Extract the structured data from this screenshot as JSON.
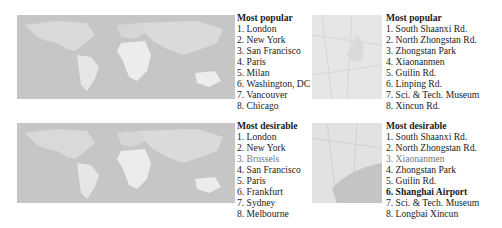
{
  "panels": [
    {
      "id": "world-popular",
      "title": "Most popular",
      "items": [
        "1. London",
        "2. New York",
        "3. San Francisco",
        "4. Paris",
        "5. Milan",
        "6. Washington, DC",
        "7. Vancouver",
        "8. Chicago"
      ]
    },
    {
      "id": "world-desirable",
      "title": "Most desirable",
      "items": [
        "1. London",
        "2. New York",
        "3. Brussels",
        "4. San Francisco",
        "5. Paris",
        "6. Frankfurt",
        "7. Sydney",
        "8. Melbourne"
      ]
    },
    {
      "id": "city-popular",
      "title": "Most popular",
      "items": [
        "1. South Shaanxi Rd.",
        "2. North Zhongstan Rd.",
        "3. Zhongstan Park",
        "4. Xiaonanmen",
        "5. Guilin Rd.",
        "6. Linping Rd.",
        "7. Sci. & Tech. Museum",
        "8. Xincun Rd."
      ]
    },
    {
      "id": "city-desirable",
      "title": "Most desirable",
      "items": [
        "1. South Shaanxi Rd.",
        "2. North Zhongstan Rd.",
        "3. Xiaonanmen",
        "4. Zhongstan Park",
        "5. Guilin Rd.",
        "6. Shanghai Airport",
        "7. Sci. & Tech. Museum",
        "8. Longbai Xincun"
      ]
    }
  ],
  "colors": {
    "ocean": "#c9c9c9",
    "land": "#ececec",
    "city_bg": "#e4e4e4",
    "water": "#b9b9b9"
  }
}
